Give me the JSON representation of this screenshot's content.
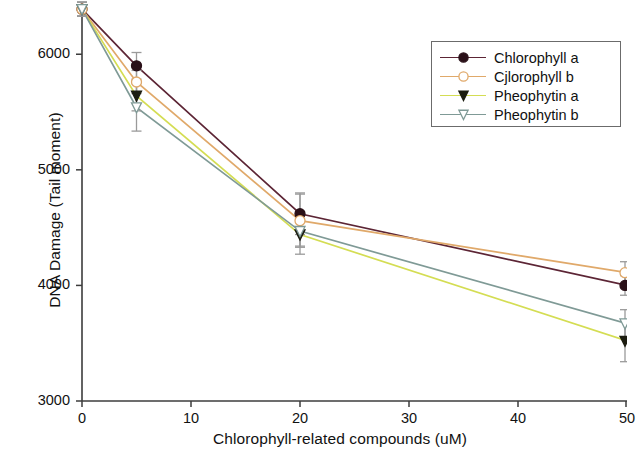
{
  "chart_data": {
    "type": "line",
    "title": "",
    "xlabel": "Chlorophyll-related compounds  (uM)",
    "ylabel": "DNA Damage (Tail moment)",
    "x": [
      0,
      5,
      20,
      50
    ],
    "xlim": [
      0,
      50
    ],
    "ylim": [
      3000,
      6400
    ],
    "xticks": [
      0,
      10,
      20,
      30,
      40,
      50
    ],
    "xtick_labels": [
      "0",
      "10",
      "20",
      "30",
      "40",
      "50"
    ],
    "yticks": [
      3000,
      4000,
      5000,
      6000
    ],
    "ytick_labels": [
      "3000",
      "4000",
      "5000",
      "6000"
    ],
    "grid": false,
    "legend_position": "top-right",
    "series": [
      {
        "name": "Chlorophyll a",
        "color": "#5c2535",
        "marker": "filled-circle",
        "marker_fill": "#2a1018",
        "values": [
          6390,
          5900,
          4620,
          4000
        ],
        "errors": [
          60,
          115,
          180,
          85
        ]
      },
      {
        "name": "Cjlorophyll b",
        "color": "#e0a96a",
        "marker": "open-circle",
        "marker_fill": "#ffffff",
        "values": [
          6390,
          5760,
          4560,
          4110
        ],
        "errors": [
          60,
          100,
          230,
          95
        ]
      },
      {
        "name": "Pheophytin a",
        "color": "#d4dd53",
        "marker": "filled-triangle-down",
        "marker_fill": "#1c1c10",
        "values": [
          6390,
          5640,
          4440,
          3520
        ],
        "errors": [
          60,
          130,
          170,
          180
        ]
      },
      {
        "name": "Pheophytin b",
        "color": "#7f9a96",
        "marker": "open-triangle-down",
        "marker_fill": "#ffffff",
        "values": [
          6390,
          5540,
          4470,
          3670
        ],
        "errors": [
          60,
          205,
          130,
          120
        ]
      }
    ]
  },
  "axes": {
    "y_title": "DNA Damage (Tail moment)",
    "x_title": "Chlorophyll-related compounds  (uM)"
  },
  "legend": {
    "entries": [
      {
        "label": "Chlorophyll a"
      },
      {
        "label": "Cjlorophyll b"
      },
      {
        "label": "Pheophytin a"
      },
      {
        "label": "Pheophytin b"
      }
    ]
  }
}
